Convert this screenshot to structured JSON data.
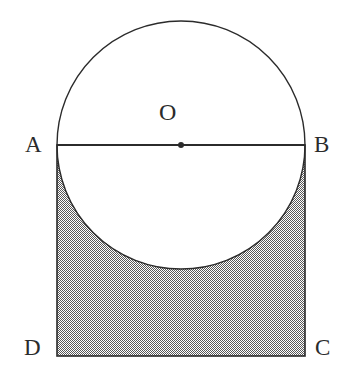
{
  "figure": {
    "background_color": "#ffffff",
    "stroke_color": "#2b2b2b",
    "shade_color": "#8c8c8c",
    "shade_pattern": "checkerboard-50-dither",
    "labels": {
      "A": "A",
      "B": "B",
      "C": "C",
      "D": "D",
      "O": "O"
    },
    "points": {
      "A": {
        "x": 57,
        "y": 145
      },
      "B": {
        "x": 305,
        "y": 145
      },
      "C": {
        "x": 305,
        "y": 356
      },
      "D": {
        "x": 57,
        "y": 356
      },
      "O": {
        "x": 181,
        "y": 145
      }
    },
    "circle": {
      "center_x": 181,
      "center_y": 145,
      "radius": 124,
      "diameter": 248
    },
    "square": {
      "left": 57,
      "top": 145,
      "right": 305,
      "bottom": 356,
      "width": 248,
      "height": 211
    },
    "segment_ab": {
      "name": "AB",
      "from": "A",
      "to": "B",
      "is_diameter": true
    },
    "center_marker": {
      "name": "O",
      "x": 181,
      "y": 145,
      "radius": 3
    },
    "shaded_region": "square minus lower semicircle"
  }
}
